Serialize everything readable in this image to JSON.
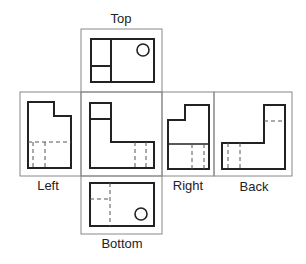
{
  "diagram": {
    "views": [
      {
        "name": "Top",
        "label": "Top"
      },
      {
        "name": "Left",
        "label": "Left"
      },
      {
        "name": "Front",
        "label": ""
      },
      {
        "name": "Right",
        "label": "Right"
      },
      {
        "name": "Back",
        "label": "Back"
      },
      {
        "name": "Bottom",
        "label": "Bottom"
      }
    ],
    "colors": {
      "frame": "#888888",
      "outline": "#222222",
      "hidden_line": "#555555",
      "background": "#ffffff"
    }
  }
}
